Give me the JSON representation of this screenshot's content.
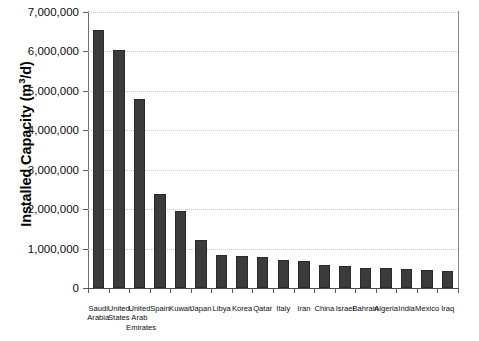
{
  "chart_data": {
    "type": "bar",
    "title": "",
    "xlabel": "",
    "ylabel": "Installed Capacity (m3/d)",
    "ylabel_prefix": "Installed Capacity (m",
    "ylabel_sup": "3",
    "ylabel_suffix": "/d)",
    "ylim": [
      0,
      7000000
    ],
    "ytick_values": [
      0,
      1000000,
      2000000,
      3000000,
      4000000,
      5000000,
      6000000,
      7000000
    ],
    "ytick_labels": [
      "0",
      "1,000,000",
      "2,000,000",
      "3,000,000",
      "4,000,000",
      "5,000,000",
      "6,000,000",
      "7,000,000"
    ],
    "grid": true,
    "grid_axis": "y",
    "legend": false,
    "bar_color": "#3b3b3b",
    "bar_edge_color": "#2a2a2a",
    "categories": [
      "Saudi\nArabia",
      "United\nStates",
      "United\nArab\nEmirates",
      "Spain",
      "Kuwait",
      "Japan",
      "Libya",
      "Korea",
      "Qatar",
      "Italy",
      "Iran",
      "China",
      "Israel",
      "Bahrain",
      "Algeria",
      "India",
      "Mexico",
      "Iraq"
    ],
    "values": [
      6550000,
      6030000,
      4800000,
      2390000,
      1960000,
      1220000,
      830000,
      810000,
      790000,
      720000,
      680000,
      590000,
      560000,
      520000,
      500000,
      490000,
      450000,
      440000
    ]
  }
}
